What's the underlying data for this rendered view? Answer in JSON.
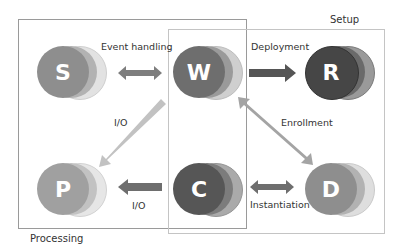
{
  "groups": {
    "processing": {
      "label": "Processing"
    },
    "setup": {
      "label": "Setup"
    }
  },
  "nodes": [
    {
      "id": "S",
      "letter": "S",
      "colors": [
        "#8e8e8e",
        "#b2b2b2",
        "#e2e2e2"
      ]
    },
    {
      "id": "W",
      "letter": "W",
      "colors": [
        "#6e6e6e",
        "#9a9a9a",
        "#cfcfcf"
      ]
    },
    {
      "id": "R",
      "letter": "R",
      "colors": [
        "#464646",
        "#6a6a6a",
        "#9a9a9a"
      ]
    },
    {
      "id": "P",
      "letter": "P",
      "colors": [
        "#a0a0a0",
        "#c2c2c2",
        "#e6e6e6"
      ]
    },
    {
      "id": "C",
      "letter": "C",
      "colors": [
        "#565656",
        "#7c7c7c",
        "#aaaaaa"
      ]
    },
    {
      "id": "D",
      "letter": "D",
      "colors": [
        "#8e8e8e",
        "#b2b2b2",
        "#dedede"
      ]
    }
  ],
  "edges": [
    {
      "from": "S",
      "to": "W",
      "label": "Event handling",
      "direction": "both",
      "color": "#7e7e7e"
    },
    {
      "from": "W",
      "to": "R",
      "label": "Deployment",
      "direction": "forward",
      "color": "#555555"
    },
    {
      "from": "W",
      "to": "P",
      "label": "I/O",
      "direction": "forward",
      "color": "#c2c2c2"
    },
    {
      "from": "D",
      "to": "W",
      "label": "Enrollment",
      "direction": "both",
      "color": "#a4a4a4"
    },
    {
      "from": "C",
      "to": "P",
      "label": "I/O",
      "direction": "forward",
      "color": "#6e6e6e"
    },
    {
      "from": "C",
      "to": "D",
      "label": "Instantiation",
      "direction": "both",
      "color": "#6e6e6e"
    }
  ]
}
